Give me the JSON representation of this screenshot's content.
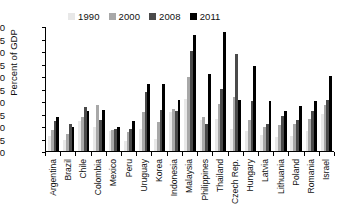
{
  "chart_data": {
    "type": "bar",
    "title": "",
    "xlabel": "",
    "ylabel": "Percent of GDP",
    "ylim": [
      0,
      50
    ],
    "ytick_values": [
      0,
      5,
      10,
      15,
      20,
      25,
      30,
      35,
      40,
      45,
      50
    ],
    "grid": false,
    "legend_position": "top",
    "categories": [
      "Argentina",
      "Brazil",
      "Chile",
      "Colombia",
      "Mexico",
      "Peru",
      "Uruguay",
      "Korea",
      "Indonesia",
      "Malaysia",
      "Philippines",
      "Thailand",
      "Czech Rep.",
      "Hungary",
      "Latvia",
      "Lithuania",
      "Poland",
      "Romania",
      "Israel"
    ],
    "series": [
      {
        "name": "1990",
        "color": "#e8e8e8",
        "values": [
          6.0,
          4.5,
          12.0,
          9.5,
          8.0,
          4.0,
          9.0,
          5.0,
          15.5,
          21.0,
          12.5,
          13.0,
          9.0,
          8.0,
          6.5,
          5.5,
          6.0,
          8.0,
          15.0
        ]
      },
      {
        "name": "2000",
        "color": "#a8a8a8",
        "values": [
          8.5,
          7.0,
          13.5,
          18.5,
          8.5,
          7.5,
          15.5,
          11.5,
          17.0,
          29.5,
          13.5,
          19.0,
          21.5,
          12.5,
          9.5,
          10.5,
          11.0,
          13.0,
          18.5
        ]
      },
      {
        "name": "2008",
        "color": "#4a4a4a",
        "values": [
          12.0,
          11.0,
          17.5,
          12.5,
          9.0,
          9.0,
          23.5,
          16.5,
          16.0,
          40.0,
          11.0,
          25.0,
          39.0,
          20.0,
          11.0,
          14.0,
          12.5,
          16.0,
          20.5
        ]
      },
      {
        "name": "2011",
        "color": "#000000",
        "values": [
          13.5,
          9.5,
          16.0,
          16.5,
          9.5,
          12.0,
          27.0,
          27.0,
          20.5,
          46.5,
          31.0,
          47.5,
          20.5,
          34.0,
          20.0,
          16.0,
          18.0,
          20.0,
          30.0
        ]
      }
    ]
  },
  "legend": {
    "entries": [
      {
        "label": "1990",
        "color": "#e8e8e8"
      },
      {
        "label": "2000",
        "color": "#a8a8a8"
      },
      {
        "label": "2008",
        "color": "#4a4a4a"
      },
      {
        "label": "2011",
        "color": "#000000"
      }
    ]
  },
  "axis": {
    "y_title": "Percent of GDP"
  }
}
